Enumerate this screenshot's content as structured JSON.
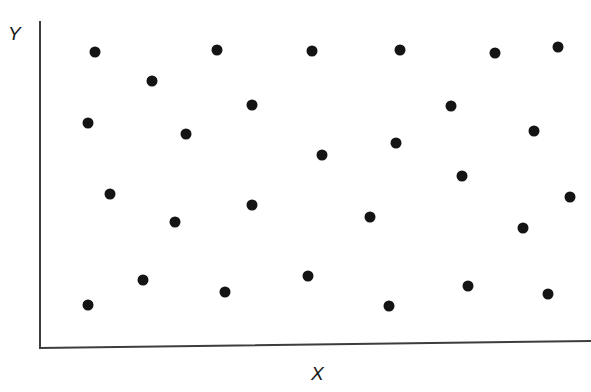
{
  "chart_data": {
    "type": "scatter",
    "title": "",
    "xlabel": "X",
    "ylabel": "Y",
    "grid": false,
    "legend": null,
    "xlim": [
      0,
      100
    ],
    "ylim": [
      0,
      100
    ],
    "axis_ticks": {
      "x": [],
      "y": []
    },
    "marker": {
      "shape": "circle",
      "color": "#141414",
      "size_px": 11
    },
    "n_points": 28,
    "points": [
      {
        "px": 95,
        "py": 52,
        "x": 10.0,
        "y": 91.0
      },
      {
        "px": 217,
        "py": 50,
        "x": 32.1,
        "y": 91.6
      },
      {
        "px": 312,
        "py": 51,
        "x": 49.4,
        "y": 91.3
      },
      {
        "px": 400,
        "py": 50,
        "x": 65.3,
        "y": 91.6
      },
      {
        "px": 495,
        "py": 53,
        "x": 82.6,
        "y": 90.7
      },
      {
        "px": 558,
        "py": 47,
        "x": 94.0,
        "y": 92.5
      },
      {
        "px": 152,
        "py": 81,
        "x": 20.3,
        "y": 82.1
      },
      {
        "px": 252,
        "py": 105,
        "x": 38.5,
        "y": 74.8
      },
      {
        "px": 451,
        "py": 106,
        "x": 74.6,
        "y": 74.5
      },
      {
        "px": 88,
        "py": 123,
        "x": 8.7,
        "y": 69.3
      },
      {
        "px": 186,
        "py": 134,
        "x": 26.5,
        "y": 66.0
      },
      {
        "px": 534,
        "py": 131,
        "x": 89.7,
        "y": 66.9
      },
      {
        "px": 396,
        "py": 143,
        "x": 64.6,
        "y": 63.2
      },
      {
        "px": 322,
        "py": 155,
        "x": 51.2,
        "y": 59.6
      },
      {
        "px": 462,
        "py": 176,
        "x": 76.6,
        "y": 53.2
      },
      {
        "px": 110,
        "py": 194,
        "x": 12.7,
        "y": 47.7
      },
      {
        "px": 252,
        "py": 205,
        "x": 38.5,
        "y": 44.4
      },
      {
        "px": 570,
        "py": 197,
        "x": 96.2,
        "y": 46.8
      },
      {
        "px": 175,
        "py": 222,
        "x": 24.5,
        "y": 39.2
      },
      {
        "px": 370,
        "py": 217,
        "x": 59.9,
        "y": 40.7
      },
      {
        "px": 523,
        "py": 228,
        "x": 87.7,
        "y": 37.4
      },
      {
        "px": 308,
        "py": 276,
        "x": 48.6,
        "y": 22.8
      },
      {
        "px": 143,
        "py": 280,
        "x": 18.7,
        "y": 21.6
      },
      {
        "px": 468,
        "py": 286,
        "x": 77.7,
        "y": 19.8
      },
      {
        "px": 225,
        "py": 292,
        "x": 33.6,
        "y": 17.9
      },
      {
        "px": 548,
        "py": 294,
        "x": 92.2,
        "y": 17.3
      },
      {
        "px": 88,
        "py": 305,
        "x": 8.7,
        "y": 14.0
      },
      {
        "px": 389,
        "py": 306,
        "x": 63.4,
        "y": 13.7
      }
    ]
  },
  "axes": {
    "y_axis": {
      "x1": 40,
      "y1": 22,
      "x2": 40,
      "y2": 348
    },
    "x_axis": {
      "x1": 40,
      "y1": 348,
      "x2": 591,
      "y2": 341
    },
    "color": "#3d3d3d",
    "width_px": 2
  },
  "labels": {
    "y": "Y",
    "x": "X"
  }
}
